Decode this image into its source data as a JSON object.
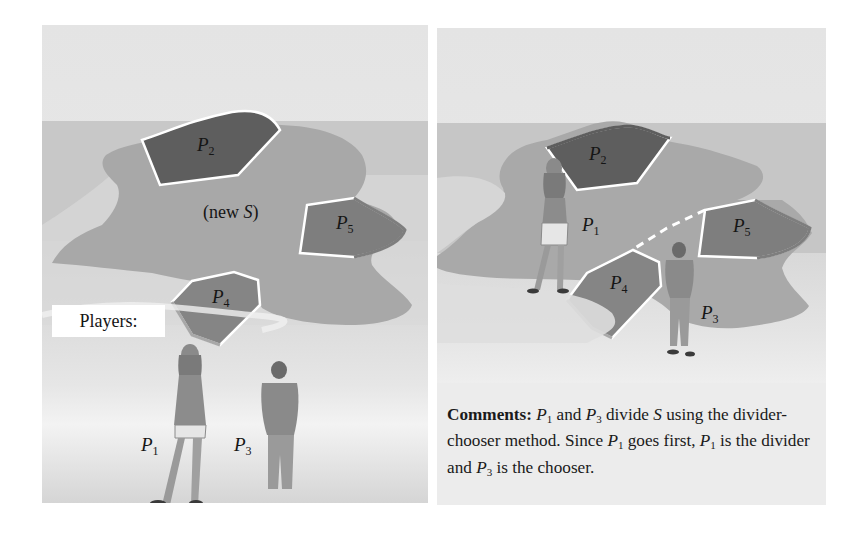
{
  "left_panel": {
    "region_labels": {
      "p2": {
        "name": "P",
        "sub": "2"
      },
      "p5": {
        "name": "P",
        "sub": "5"
      },
      "p4": {
        "name": "P",
        "sub": "4"
      }
    },
    "center_label_prefix": "(new ",
    "center_label_var": "S",
    "center_label_suffix": ")",
    "players_label": "Players:",
    "player_labels": {
      "p1": {
        "name": "P",
        "sub": "1"
      },
      "p3": {
        "name": "P",
        "sub": "3"
      }
    }
  },
  "right_panel": {
    "region_labels": {
      "p2": {
        "name": "P",
        "sub": "2"
      },
      "p1": {
        "name": "P",
        "sub": "1"
      },
      "p5": {
        "name": "P",
        "sub": "5"
      },
      "p4": {
        "name": "P",
        "sub": "4"
      },
      "p3": {
        "name": "P",
        "sub": "3"
      }
    },
    "comments": {
      "heading": "Comments:",
      "text_parts": {
        "a": "P",
        "a_sub": "1",
        "b": " and ",
        "c": "P",
        "c_sub": "3",
        "d": " divide ",
        "e": "S",
        "f": " using the divider-chooser method.  Since ",
        "g": "P",
        "g_sub": "1",
        "h": " goes first, ",
        "i": "P",
        "i_sub": "1",
        "j": " is the divider and ",
        "k": "P",
        "k_sub": "3",
        "l": " is the chooser."
      }
    }
  },
  "colors": {
    "sky": "#e6e6e6",
    "sea": "#c9c9c9",
    "foam": "#e2e2e2",
    "land": "#a9a9a9",
    "region_dark": "#5e5e5e",
    "region_mid": "#7d7d7d",
    "boundary": "#ffffff"
  }
}
